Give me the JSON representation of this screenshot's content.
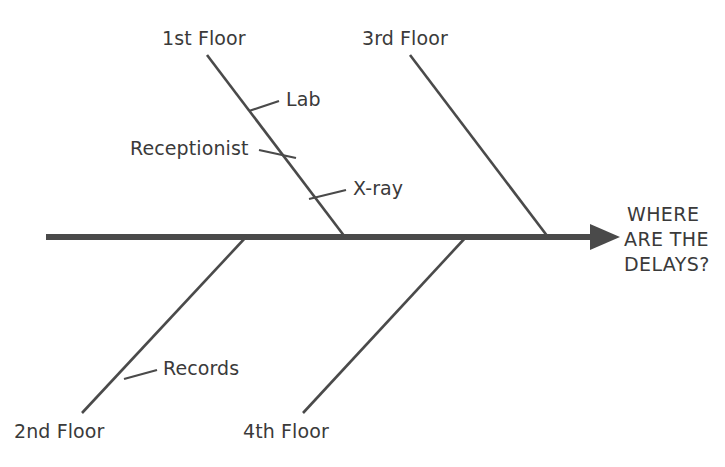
{
  "diagram": {
    "type": "fishbone-ishikawa",
    "title_text": "",
    "background_color": "#ffffff",
    "line_color": "#4a4a4a",
    "spine_color": "#4a4a4a",
    "text_color": "#3a3a3a",
    "effect": {
      "name": "effect-statement",
      "line1": "WHERE",
      "line2": "ARE THE",
      "line3": "DELAYS?"
    },
    "categories": [
      {
        "id": "first-floor",
        "label": "1st Floor",
        "position": "upper",
        "causes": [
          {
            "id": "lab",
            "label": "Lab"
          },
          {
            "id": "receptionist",
            "label": "Receptionist"
          },
          {
            "id": "xray",
            "label": "X-ray"
          }
        ]
      },
      {
        "id": "third-floor",
        "label": "3rd Floor",
        "position": "upper",
        "causes": []
      },
      {
        "id": "second-floor",
        "label": "2nd Floor",
        "position": "lower",
        "causes": [
          {
            "id": "records",
            "label": "Records"
          }
        ]
      },
      {
        "id": "fourth-floor",
        "label": "4th Floor",
        "position": "lower",
        "causes": []
      }
    ]
  }
}
